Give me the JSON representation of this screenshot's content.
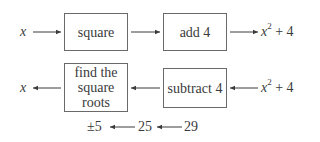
{
  "diagram": {
    "top_row": {
      "input": {
        "var": "x"
      },
      "box1": {
        "label": "square"
      },
      "box2": {
        "label": "add 4"
      },
      "output": {
        "var": "x",
        "exp": "2",
        "rest": " + 4"
      }
    },
    "middle_row": {
      "input": {
        "var": "x",
        "exp": "2",
        "rest": " + 4"
      },
      "box1": {
        "label": "subtract 4"
      },
      "box2": {
        "line1": "find the",
        "line2": "square",
        "line3": "roots"
      },
      "output": {
        "var": "x"
      }
    },
    "bottom_row": {
      "start": "29",
      "middle": "25",
      "result": "±5"
    }
  }
}
